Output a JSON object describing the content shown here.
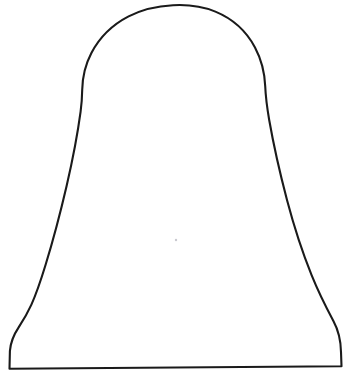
{
  "document": {
    "title": "Bell Outline Drawing",
    "kind": "line-drawing",
    "background_color": "#ffffff",
    "canvas": {
      "width": 351,
      "height": 379
    }
  },
  "drawing": {
    "subject_name": "bell-silhouette",
    "description": "Hand-drawn black outline of a bell / dome shape with flared skirt on a plain white background",
    "stroke_color": "#1a1a1a",
    "fill_color": "#ffffff",
    "stroke_width": 2.1,
    "text_labels": [],
    "outline_path": "M 9.5 368.8 L 341.5 366.2 L 341.0 352.0 C 340.8 340.0 338.6 330.6 333.4 321.0 C 326.0 307.2 318.2 291.6 311.6 275.2 C 303.4 254.8 294.4 228.0 287.0 200.0 C 279.8 172.6 273.4 144.0 269.2 120.0 C 266.9 106.6 265.6 95.4 265.2 86.0 C 264.6 72.0 261.4 59.4 255.0 47.4 C 246.4 31.2 232.4 18.6 215.4 11.6 C 202.0 6.1 187.6 4.4 173.0 5.2 C 157.2 6.0 142.0 9.4 128.6 16.4 C 112.4 24.8 99.4 37.6 91.4 53.0 C 85.2 64.8 82.4 77.0 82.2 90.0 C 82.1 97.0 81.6 104.0 80.6 111.6 C 77.6 134.0 72.6 160.0 66.6 186.0 C 60.0 214.4 52.6 242.0 45.6 264.8 C 40.4 281.8 35.6 295.4 31.4 304.6 C 27.0 314.2 23.0 320.8 18.8 327.2 C 13.6 335.0 10.6 342.4 9.9 351.0 Z"
  },
  "marks": {
    "smudge": {
      "x": 176,
      "y": 240,
      "radius": 1.2,
      "color": "#c9c9cf"
    }
  }
}
